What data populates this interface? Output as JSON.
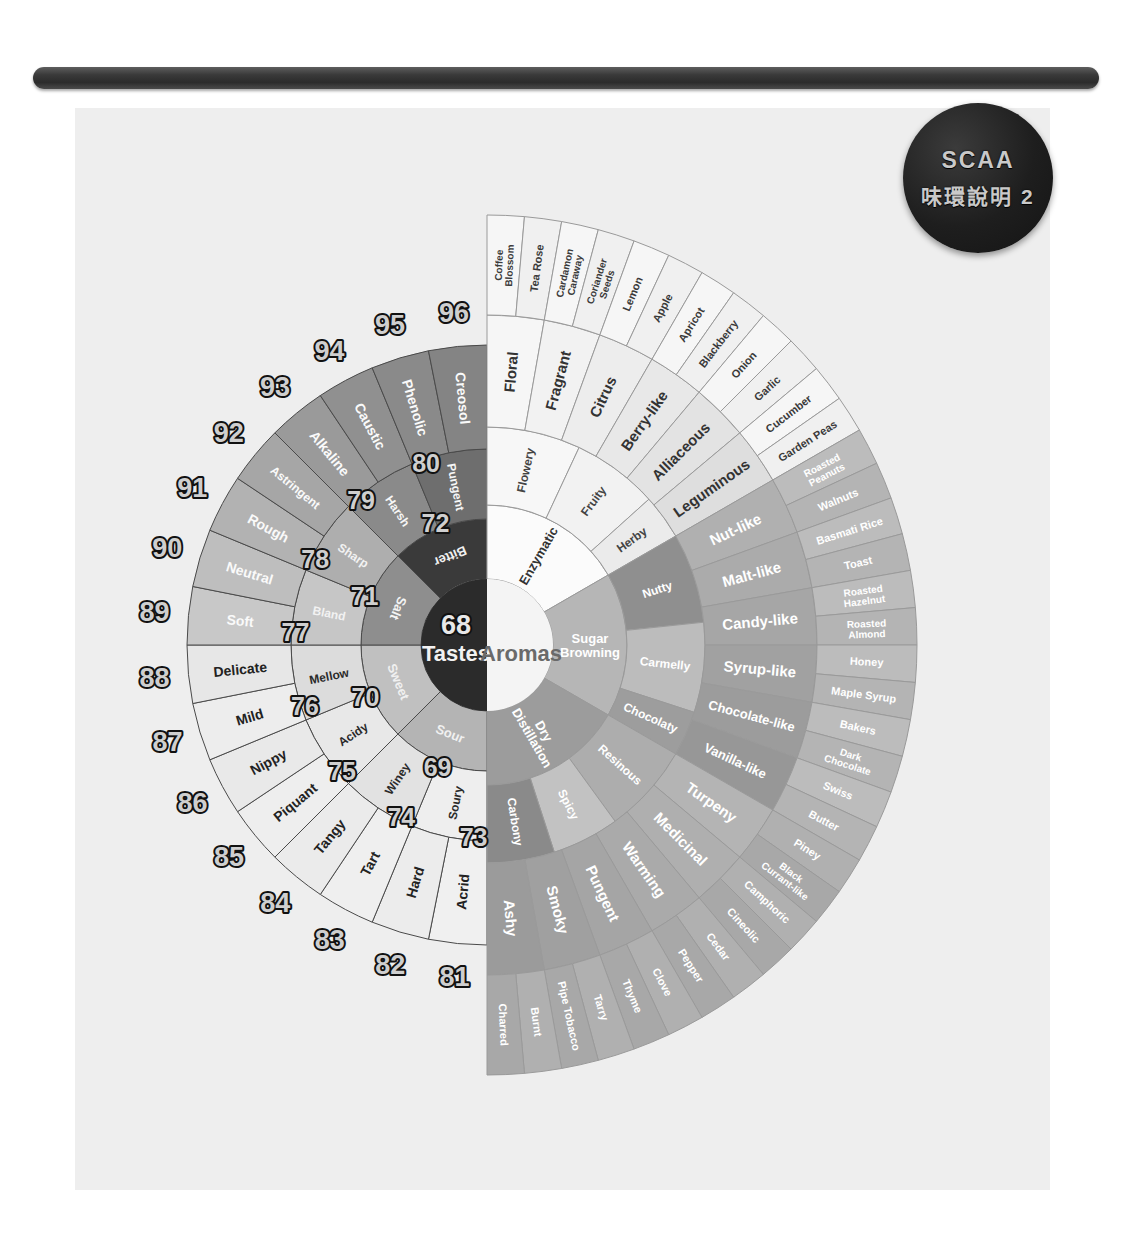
{
  "poster": {
    "badge": {
      "line1": "SCAA",
      "line2": "味環說明 2"
    },
    "background_color": "#eeeeee",
    "rod_color": "#3a3a3a"
  },
  "center": {
    "number": "68",
    "left_label": "Tastes",
    "right_label": "Aromas",
    "left_color": "#2b2b2b",
    "right_color": "#f4f4f4"
  },
  "chart_data": {
    "type": "pie",
    "halves": [
      "Tastes",
      "Aromas"
    ],
    "tastes": {
      "ring1": [
        {
          "n": "69",
          "label": "Sour"
        },
        {
          "n": "70",
          "label": "Sweet"
        },
        {
          "n": "71",
          "label": "Salt"
        },
        {
          "n": "72",
          "label": "Bitter"
        }
      ],
      "ring2": [
        {
          "n": "73",
          "label": "Soury"
        },
        {
          "n": "74",
          "label": "Winey"
        },
        {
          "n": "75",
          "label": "Acidy"
        },
        {
          "n": "76",
          "label": "Mellow"
        },
        {
          "n": "77",
          "label": "Bland"
        },
        {
          "n": "78",
          "label": "Sharp"
        },
        {
          "n": "79",
          "label": "Harsh"
        },
        {
          "n": "80",
          "label": "Pungent"
        }
      ],
      "ring3": [
        {
          "n": "81",
          "label": "Acrid"
        },
        {
          "n": "82",
          "label": "Hard"
        },
        {
          "n": "83",
          "label": "Tart"
        },
        {
          "n": "84",
          "label": "Tangy"
        },
        {
          "n": "85",
          "label": "Piquant"
        },
        {
          "n": "86",
          "label": "Nippy"
        },
        {
          "n": "87",
          "label": "Mild"
        },
        {
          "n": "88",
          "label": "Delicate"
        },
        {
          "n": "89",
          "label": "Soft"
        },
        {
          "n": "90",
          "label": "Neutral"
        },
        {
          "n": "91",
          "label": "Rough"
        },
        {
          "n": "92",
          "label": "Astringent"
        },
        {
          "n": "93",
          "label": "Alkaline"
        },
        {
          "n": "94",
          "label": "Caustic"
        },
        {
          "n": "95",
          "label": "Phenolic"
        },
        {
          "n": "96",
          "label": "Creosol"
        }
      ]
    },
    "aromas": {
      "ring1": [
        "Enzymatic",
        "Sugar Browning",
        "Dry Distillation"
      ],
      "ring2": [
        "Flowery",
        "Fruity",
        "Herby",
        "Nutty",
        "Carmelly",
        "Chocolaty",
        "Resinous",
        "Spicy",
        "Carbony"
      ],
      "ring3": [
        "Floral",
        "Fragrant",
        "Citrus",
        "Berry-like",
        "Alliaceous",
        "Leguminous",
        "Nut-like",
        "Malt-like",
        "Candy-like",
        "Syrup-like",
        "Chocolate-like",
        "Vanilla-like",
        "Turpeny",
        "Medicinal",
        "Warming",
        "Pungent",
        "Smoky",
        "Ashy"
      ],
      "ring4": [
        "Coffee Blossom",
        "Tea Rose",
        "Cardamon Caraway",
        "Coriander Seeds",
        "Lemon",
        "Apple",
        "Apricot",
        "Blackberry",
        "Onion",
        "Garlic",
        "Cucumber",
        "Garden Peas",
        "Roasted Peanuts",
        "Walnuts",
        "Basmati Rice",
        "Toast",
        "Roasted Hazelnut",
        "Roasted Almond",
        "Honey",
        "Maple Syrup",
        "Bakers",
        "Dark Chocolate",
        "Swiss",
        "Butter",
        "Piney",
        "Black Currant-like",
        "Camphoric",
        "Cineolic",
        "Cedar",
        "Pepper",
        "Clove",
        "Thyme",
        "Tarry",
        "Pipe Tobacco",
        "Burnt",
        "Charred"
      ]
    }
  }
}
